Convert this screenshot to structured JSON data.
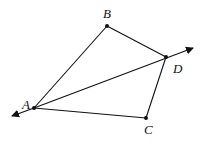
{
  "diagram": {
    "type": "quadrilateral-with-line",
    "stroke_color": "#111111",
    "background": "#ffffff",
    "points": {
      "A": {
        "label": "A",
        "x": 34,
        "y": 108,
        "label_x": 22,
        "label_y": 109
      },
      "B": {
        "label": "B",
        "x": 107,
        "y": 26,
        "label_x": 103,
        "label_y": 18
      },
      "C": {
        "label": "C",
        "x": 146,
        "y": 118,
        "label_x": 144,
        "label_y": 134
      },
      "D": {
        "label": "D",
        "x": 166,
        "y": 57,
        "label_x": 173,
        "label_y": 73
      }
    },
    "segments": [
      [
        "A",
        "B"
      ],
      [
        "B",
        "D"
      ],
      [
        "D",
        "C"
      ],
      [
        "C",
        "A"
      ]
    ],
    "line": {
      "through": [
        "A",
        "D"
      ],
      "arrows_both_ends": true
    }
  }
}
